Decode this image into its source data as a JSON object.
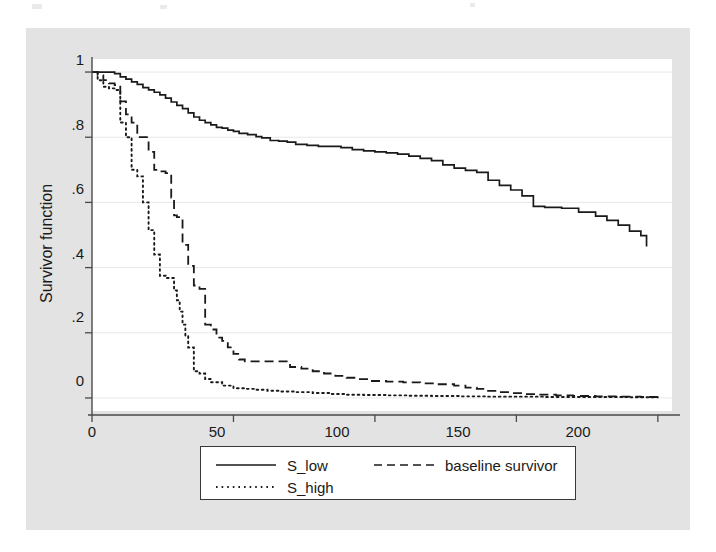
{
  "chart_data": {
    "type": "line",
    "title": "",
    "subtitle": "",
    "xlabel": "_t",
    "ylabel": "Survivor function",
    "xlim": [
      0,
      205
    ],
    "ylim": [
      -0.04,
      1.04
    ],
    "xticks": [
      0,
      50,
      100,
      150,
      200
    ],
    "xtick_labels": [
      "0",
      "50",
      "100",
      "150",
      "200"
    ],
    "yticks": [
      0,
      0.2,
      0.4,
      0.6,
      0.8,
      1
    ],
    "ytick_labels": [
      "0",
      ".2",
      ".4",
      ".6",
      ".8",
      "1"
    ],
    "grid": "horizontal",
    "legend_position": "below-center",
    "step": "post",
    "series": [
      {
        "name": "S_low",
        "style": "solid",
        "color": "#1a1a1a",
        "x": [
          0,
          3,
          6,
          8,
          10,
          12,
          14,
          16,
          18,
          20,
          22,
          24,
          26,
          28,
          30,
          32,
          34,
          36,
          38,
          40,
          42,
          44,
          46,
          48,
          50,
          52,
          55,
          58,
          60,
          63,
          66,
          69,
          72,
          76,
          80,
          84,
          88,
          92,
          96,
          100,
          104,
          108,
          112,
          116,
          120,
          124,
          128,
          132,
          136,
          140,
          144,
          148,
          152,
          156,
          160,
          166,
          172,
          178,
          182,
          186,
          190,
          194,
          196
        ],
        "y": [
          1.0,
          1.0,
          1.0,
          0.995,
          0.985,
          0.978,
          0.97,
          0.962,
          0.952,
          0.945,
          0.938,
          0.93,
          0.92,
          0.908,
          0.898,
          0.888,
          0.875,
          0.862,
          0.852,
          0.845,
          0.838,
          0.83,
          0.828,
          0.822,
          0.818,
          0.812,
          0.808,
          0.802,
          0.798,
          0.79,
          0.788,
          0.785,
          0.778,
          0.775,
          0.772,
          0.772,
          0.768,
          0.762,
          0.758,
          0.755,
          0.752,
          0.748,
          0.742,
          0.735,
          0.728,
          0.715,
          0.705,
          0.698,
          0.692,
          0.668,
          0.652,
          0.638,
          0.62,
          0.588,
          0.585,
          0.582,
          0.57,
          0.558,
          0.545,
          0.53,
          0.512,
          0.498,
          0.465
        ]
      },
      {
        "name": "baseline survivor",
        "style": "dashed",
        "color": "#1a1a1a",
        "x": [
          0,
          2,
          4,
          6,
          8,
          10,
          12,
          14,
          16,
          18,
          20,
          22,
          24,
          26,
          28,
          29,
          30,
          31,
          32,
          34,
          36,
          38,
          40,
          42,
          44,
          46,
          48,
          50,
          52,
          54,
          58,
          62,
          66,
          70,
          74,
          78,
          82,
          86,
          90,
          94,
          98,
          104,
          110,
          116,
          122,
          128,
          132,
          136,
          140,
          144,
          148,
          152,
          158,
          164,
          170,
          178,
          186,
          194,
          200
        ],
        "y": [
          1.0,
          0.99,
          0.975,
          0.965,
          0.96,
          0.91,
          0.87,
          0.845,
          0.8,
          0.8,
          0.755,
          0.7,
          0.695,
          0.69,
          0.615,
          0.56,
          0.555,
          0.555,
          0.47,
          0.405,
          0.345,
          0.335,
          0.225,
          0.21,
          0.185,
          0.175,
          0.155,
          0.135,
          0.118,
          0.112,
          0.112,
          0.112,
          0.112,
          0.095,
          0.09,
          0.082,
          0.075,
          0.068,
          0.062,
          0.058,
          0.052,
          0.05,
          0.048,
          0.045,
          0.042,
          0.038,
          0.032,
          0.028,
          0.022,
          0.018,
          0.015,
          0.012,
          0.01,
          0.008,
          0.006,
          0.005,
          0.004,
          0.003,
          0.003
        ]
      },
      {
        "name": "S_high",
        "style": "dotted",
        "color": "#1a1a1a",
        "x": [
          0,
          2,
          4,
          6,
          8,
          10,
          12,
          14,
          16,
          18,
          20,
          22,
          24,
          26,
          28,
          29,
          30,
          31,
          32,
          33,
          34,
          36,
          38,
          40,
          42,
          46,
          50,
          54,
          58,
          62,
          66,
          72,
          78,
          84,
          90,
          96,
          104,
          112,
          120,
          130,
          140,
          150,
          160,
          170,
          180,
          190,
          200
        ],
        "y": [
          1.0,
          0.975,
          0.955,
          0.95,
          0.945,
          0.845,
          0.8,
          0.7,
          0.68,
          0.6,
          0.515,
          0.44,
          0.375,
          0.368,
          0.368,
          0.33,
          0.3,
          0.265,
          0.225,
          0.19,
          0.155,
          0.082,
          0.075,
          0.058,
          0.048,
          0.038,
          0.03,
          0.028,
          0.025,
          0.022,
          0.02,
          0.018,
          0.015,
          0.012,
          0.01,
          0.009,
          0.008,
          0.007,
          0.006,
          0.005,
          0.004,
          0.004,
          0.003,
          0.003,
          0.003,
          0.002,
          0.002
        ]
      }
    ]
  },
  "axis": {
    "y_title": "Survivor function",
    "x_title": "_t",
    "y_tick_labels": [
      "1",
      ".8",
      ".6",
      ".4",
      ".2",
      "0"
    ],
    "x_tick_labels": [
      "0",
      "50",
      "100",
      "150",
      "200"
    ]
  },
  "legend": {
    "entries": [
      {
        "label": "S_low",
        "style": "solid"
      },
      {
        "label": "baseline survivor",
        "style": "dashed"
      },
      {
        "label": "S_high",
        "style": "dotted"
      }
    ]
  },
  "colors": {
    "panel_background": "#e3e3e3",
    "plot_background": "#ffffff",
    "ink": "#1a1a1a",
    "gridline": "#e8e8e8",
    "axis_line": "#4a4a4a"
  }
}
